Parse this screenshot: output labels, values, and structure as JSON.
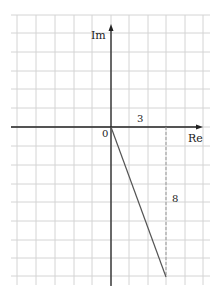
{
  "diagram": {
    "type": "complex-plane",
    "axes": {
      "x_label": "Re",
      "y_label": "Im",
      "origin_label": "0"
    },
    "grid": {
      "origin_px": [
        111,
        127
      ],
      "cell_px": 18.6,
      "x_lines_px": [
        17,
        36,
        55,
        74,
        92,
        111,
        129,
        148,
        166,
        185,
        203
      ],
      "y_lines_px": [
        15,
        33,
        52,
        71,
        89,
        108,
        127,
        146,
        165,
        184,
        202,
        221,
        240,
        258,
        276
      ],
      "left": 11,
      "right": 210,
      "top": 15,
      "bottom": 285
    },
    "point": {
      "re": 3,
      "im": -8
    },
    "annotations": {
      "re_value_label": "3",
      "im_value_label": "8"
    },
    "colors": {
      "grid": "#d4d4d4",
      "axis": "#222222",
      "segment": "#555555",
      "dashed": "#999999"
    }
  }
}
